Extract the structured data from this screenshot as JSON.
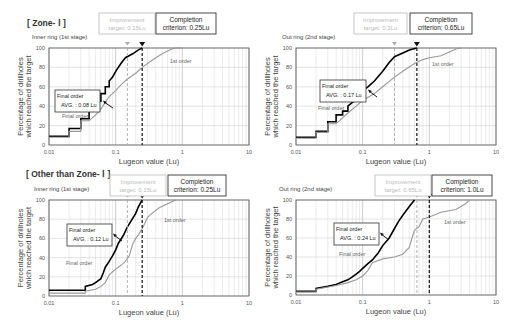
{
  "sections": {
    "zone1": "[ Zone- Ⅰ ]",
    "other": "[ Other than Zone- Ⅰ ]"
  },
  "chart_data": [
    {
      "type": "line",
      "section": "[ Zone- Ⅰ ]",
      "subtitle": "Inner ring (1st stage)",
      "xlabel": "Lugeon value (Lu)",
      "ylabel": "Percentage of drillholes which reached the target",
      "xscale": "log",
      "xlim": [
        0.01,
        10
      ],
      "ylim": [
        0,
        100
      ],
      "xticks": [
        "0.01",
        "0.1",
        "1",
        "10"
      ],
      "yticks": [
        "0",
        "20",
        "40",
        "60",
        "80",
        "100"
      ],
      "improvement_target": {
        "label": "Improvement target: 0.15Lu",
        "value": 0.15
      },
      "completion_criterion": {
        "label": "Completion criterion: 0.25Lu",
        "value": 0.25
      },
      "annotation": {
        "line1": "Final order",
        "line2": "AVG. : 0.08 Lu"
      },
      "series": [
        {
          "name": "Final order",
          "color": "#000000",
          "x": [
            0.01,
            0.02,
            0.02,
            0.03,
            0.03,
            0.04,
            0.04,
            0.05,
            0.05,
            0.06,
            0.06,
            0.07,
            0.07,
            0.08,
            0.08,
            0.09,
            0.1,
            0.12,
            0.14,
            0.18,
            0.22,
            0.25
          ],
          "y": [
            9,
            9,
            17,
            17,
            27,
            27,
            36,
            36,
            45,
            45,
            53,
            53,
            60,
            60,
            66,
            70,
            76,
            84,
            90,
            94,
            98,
            100
          ]
        },
        {
          "name": "1st order",
          "color": "#999999",
          "x": [
            0.01,
            0.02,
            0.02,
            0.03,
            0.03,
            0.04,
            0.05,
            0.06,
            0.07,
            0.08,
            0.1,
            0.12,
            0.15,
            0.2,
            0.25,
            0.3,
            0.4,
            0.5,
            0.6,
            0.7,
            0.8,
            1.0
          ],
          "y": [
            8,
            8,
            14,
            14,
            25,
            25,
            31,
            37,
            44,
            50,
            56,
            62,
            68,
            74,
            80,
            84,
            90,
            94,
            97,
            99,
            100,
            100
          ]
        }
      ],
      "series_labels": {
        "final": "Final order",
        "first": "1st order"
      }
    },
    {
      "type": "line",
      "section": "[ Zone- Ⅰ ]",
      "subtitle": "Out ring (2nd stage)",
      "xlabel": "Lugeon value (Lu)",
      "ylabel": "Percentage of drillholes which reached the target",
      "xscale": "log",
      "xlim": [
        0.01,
        10
      ],
      "ylim": [
        0,
        100
      ],
      "xticks": [
        "0.01",
        "0.1",
        "1",
        "10"
      ],
      "yticks": [
        "0",
        "20",
        "40",
        "60",
        "80",
        "100"
      ],
      "improvement_target": {
        "label": "Improvement target: 0.3Lu",
        "value": 0.3
      },
      "completion_criterion": {
        "label": "Completion criterion: 0.65Lu",
        "value": 0.65
      },
      "annotation": {
        "line1": "Final order",
        "line2": "AVG. : 0.17 Lu"
      },
      "series": [
        {
          "name": "Final order",
          "color": "#000000",
          "x": [
            0.01,
            0.02,
            0.02,
            0.03,
            0.03,
            0.04,
            0.04,
            0.05,
            0.05,
            0.06,
            0.06,
            0.07,
            0.08,
            0.09,
            0.1,
            0.12,
            0.15,
            0.2,
            0.25,
            0.3,
            0.4,
            0.5,
            0.65
          ],
          "y": [
            8,
            8,
            14,
            14,
            24,
            24,
            31,
            31,
            35,
            35,
            40,
            44,
            46,
            49,
            56,
            60,
            66,
            76,
            85,
            91,
            95,
            98,
            100
          ]
        },
        {
          "name": "1st order",
          "color": "#999999",
          "x": [
            0.01,
            0.02,
            0.02,
            0.03,
            0.03,
            0.04,
            0.05,
            0.06,
            0.08,
            0.1,
            0.15,
            0.2,
            0.3,
            0.4,
            0.6,
            0.8,
            1.0,
            1.5,
            2.0,
            2.5,
            3.0
          ],
          "y": [
            7,
            7,
            13,
            13,
            22,
            22,
            28,
            33,
            40,
            46,
            53,
            60,
            70,
            76,
            84,
            88,
            90,
            92,
            96,
            99,
            100
          ]
        }
      ],
      "series_labels": {
        "final": "Final order",
        "first": "1st order"
      }
    },
    {
      "type": "line",
      "section": "[ Other than Zone- Ⅰ ]",
      "subtitle": "Inner ring (1st stage)",
      "xlabel": "Lugeon value (Lu)",
      "ylabel": "Percentage of drillholes which reached the target",
      "xscale": "log",
      "xlim": [
        0.01,
        10
      ],
      "ylim": [
        0,
        100
      ],
      "xticks": [
        "0.01",
        "0.1",
        "1",
        "10"
      ],
      "yticks": [
        "0",
        "20",
        "40",
        "60",
        "80",
        "100"
      ],
      "improvement_target": {
        "label": "Improvement target: 0.15Lu",
        "value": 0.15
      },
      "completion_criterion": {
        "label": "Completion criterion: 0.25Lu",
        "value": 0.25
      },
      "annotation": {
        "line1": "Final order",
        "line2": "AVG. : 0.12 Lu"
      },
      "series": [
        {
          "name": "Final order",
          "color": "#000000",
          "x": [
            0.01,
            0.035,
            0.035,
            0.045,
            0.05,
            0.06,
            0.065,
            0.07,
            0.08,
            0.09,
            0.1,
            0.11,
            0.13,
            0.15,
            0.17,
            0.2,
            0.22,
            0.25
          ],
          "y": [
            6,
            6,
            10,
            12,
            14,
            18,
            24,
            30,
            36,
            42,
            48,
            55,
            63,
            72,
            78,
            86,
            93,
            100
          ]
        },
        {
          "name": "1st order",
          "color": "#999999",
          "x": [
            0.01,
            0.035,
            0.035,
            0.05,
            0.06,
            0.07,
            0.08,
            0.1,
            0.12,
            0.14,
            0.16,
            0.18,
            0.2,
            0.22,
            0.25,
            0.3,
            0.35,
            0.45,
            0.6,
            0.8
          ],
          "y": [
            3,
            3,
            5,
            7,
            10,
            14,
            22,
            28,
            32,
            36,
            42,
            54,
            60,
            64,
            70,
            82,
            86,
            92,
            96,
            100
          ]
        }
      ],
      "series_labels": {
        "final": "Final order",
        "first": "1st order"
      }
    },
    {
      "type": "line",
      "section": "[ Other than Zone- Ⅰ ]",
      "subtitle": "Out ring (2nd stage)",
      "xlabel": "Lugeon value (Lu)",
      "ylabel": "Percentage of drillholes which reached the target",
      "xscale": "log",
      "xlim": [
        0.01,
        10
      ],
      "ylim": [
        0,
        100
      ],
      "xticks": [
        "0.01",
        "0.1",
        "1",
        "10"
      ],
      "yticks": [
        "0",
        "20",
        "40",
        "60",
        "80",
        "100"
      ],
      "improvement_target": {
        "label": "Improvement target: 0.65Lu",
        "value": 0.65
      },
      "completion_criterion": {
        "label": "Completion criterion: 1.0Lu",
        "value": 1.0
      },
      "annotation": {
        "line1": "Final order",
        "line2": "AVG. : 0.24 Lu"
      },
      "series": [
        {
          "name": "Final order",
          "color": "#000000",
          "x": [
            0.01,
            0.02,
            0.02,
            0.03,
            0.04,
            0.05,
            0.06,
            0.07,
            0.08,
            0.09,
            0.1,
            0.12,
            0.14,
            0.17,
            0.2,
            0.25,
            0.3,
            0.35,
            0.4,
            0.5,
            0.6
          ],
          "y": [
            4,
            4,
            7,
            9,
            11,
            14,
            16,
            19,
            22,
            25,
            28,
            33,
            37,
            44,
            52,
            60,
            70,
            78,
            84,
            93,
            100
          ]
        },
        {
          "name": "1st order",
          "color": "#999999",
          "x": [
            0.01,
            0.02,
            0.02,
            0.04,
            0.06,
            0.08,
            0.1,
            0.12,
            0.14,
            0.2,
            0.3,
            0.4,
            0.5,
            0.55,
            0.6,
            0.7,
            0.8,
            1.0,
            1.5,
            2.5,
            3.5,
            4.0
          ],
          "y": [
            3,
            3,
            6,
            10,
            13,
            16,
            20,
            26,
            34,
            38,
            40,
            43,
            50,
            60,
            68,
            72,
            80,
            82,
            87,
            90,
            96,
            100
          ]
        }
      ],
      "series_labels": {
        "final": "Final order",
        "first": "1st order"
      }
    }
  ]
}
